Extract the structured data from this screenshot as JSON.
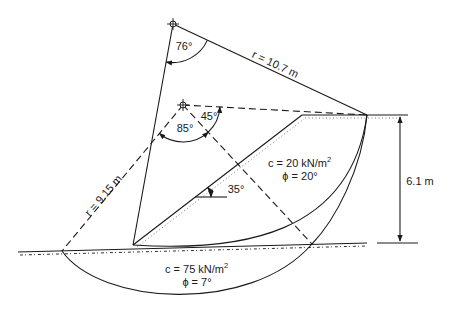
{
  "diagram": {
    "upper_circle": {
      "radius_label": "r = 10.7 m",
      "angle_label": "76°"
    },
    "lower_circle": {
      "radius_label": "r = 9.15 m",
      "angle_label_a": "85°",
      "angle_label_b": "45°"
    },
    "slope": {
      "angle_label": "35°",
      "height_label": "6.1 m"
    },
    "upper_layer": {
      "cohesion": "c = 20 kN/m",
      "cohesion_sup": "2",
      "friction": "ϕ = 20°"
    },
    "lower_layer": {
      "cohesion": "c = 75 kN/m",
      "cohesion_sup": "2",
      "friction": "ϕ = 7°"
    }
  },
  "colors": {
    "ink": "#1a1a1a",
    "background": "#ffffff"
  }
}
